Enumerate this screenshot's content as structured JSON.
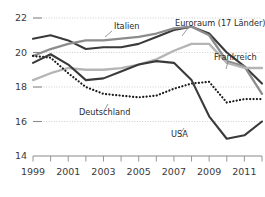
{
  "chart_data": {
    "type": "line",
    "title": "",
    "xlabel": "",
    "ylabel": "",
    "ylim": [
      14,
      22
    ],
    "xlim": [
      1999,
      2012
    ],
    "grid": true,
    "legend_position": "inline-annotations",
    "y_ticks": [
      "22",
      "20",
      "18",
      "16",
      "14"
    ],
    "y_tick_values": [
      22,
      20,
      18,
      16,
      14
    ],
    "x_ticks": [
      "1999",
      "2001",
      "2003",
      "2005",
      "2007",
      "2009",
      "2011"
    ],
    "x_tick_values": [
      1999,
      2001,
      2003,
      2005,
      2007,
      2009,
      2011
    ],
    "x_minor_values": [
      2000,
      2002,
      2004,
      2006,
      2008,
      2010,
      2012
    ],
    "x": [
      1999,
      2000,
      2001,
      2002,
      2003,
      2004,
      2005,
      2006,
      2007,
      2008,
      2009,
      2010,
      2011,
      2012
    ],
    "series": [
      {
        "name": "Italien",
        "color": "#3a3a3a",
        "width": 2.1,
        "style": "solid",
        "values": [
          20.8,
          21.0,
          20.7,
          20.2,
          20.3,
          20.3,
          20.5,
          20.9,
          21.3,
          21.5,
          21.1,
          20.0,
          19.2,
          18.2
        ]
      },
      {
        "name": "Euroraum (17 Länder)",
        "color": "#8c8c8c",
        "width": 2.3,
        "style": "solid",
        "values": [
          19.8,
          20.2,
          20.5,
          20.7,
          20.7,
          20.8,
          20.9,
          21.1,
          21.4,
          21.5,
          21.0,
          19.5,
          19.2,
          17.6
        ]
      },
      {
        "name": "Frankreich",
        "color": "#b5b5b5",
        "width": 2.3,
        "style": "solid",
        "values": [
          18.4,
          18.8,
          19.1,
          19.0,
          19.0,
          19.1,
          19.3,
          19.6,
          20.1,
          20.5,
          20.5,
          19.4,
          19.1,
          19.1
        ]
      },
      {
        "name": "Deutschland",
        "color": "#1a1a1a",
        "width": 2.2,
        "style": "dotted",
        "values": [
          19.8,
          19.7,
          18.8,
          18.0,
          17.6,
          17.5,
          17.4,
          17.5,
          17.9,
          18.2,
          18.3,
          17.1,
          17.3,
          17.3
        ]
      },
      {
        "name": "USA",
        "color": "#3a3a3a",
        "width": 2.1,
        "style": "solid",
        "values": [
          19.4,
          19.9,
          19.3,
          18.4,
          18.5,
          18.9,
          19.3,
          19.5,
          19.4,
          18.4,
          16.3,
          15.0,
          15.2,
          16.0
        ]
      }
    ],
    "annotations": [
      {
        "label": "Italien",
        "x": 114,
        "y": 29,
        "leader": "M112,31 L105,37"
      },
      {
        "label": "Euroraum (17 Länder)",
        "x": 175,
        "y": 26,
        "leader": "M188,28 L182,36"
      },
      {
        "label": "Frankreich",
        "x": 214,
        "y": 60,
        "leader": "M228,62 L226,69"
      },
      {
        "label": "Deutschland",
        "x": 79,
        "y": 115,
        "leader": "M104,111 L108,104"
      },
      {
        "label": "USA",
        "x": 171,
        "y": 137,
        "leader": "M180,134 L184,128"
      }
    ]
  }
}
